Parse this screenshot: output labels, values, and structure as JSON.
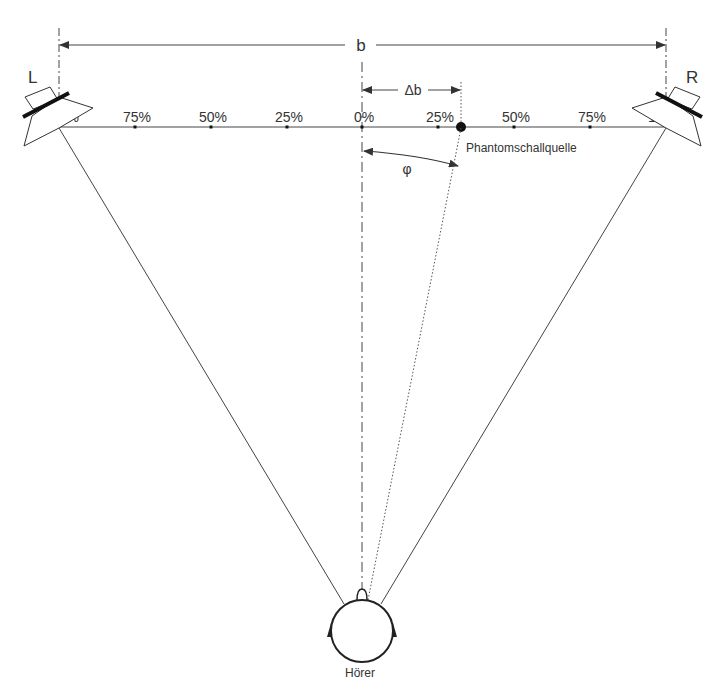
{
  "diagram": {
    "speakers": {
      "left_label": "L",
      "right_label": "R"
    },
    "base_width_label": "b",
    "offset_label": "Δb",
    "angle_label": "φ",
    "phantom_source_label": "Phantomschallquelle",
    "listener_label": "Hörer",
    "scale": {
      "left_ticks": [
        "100%",
        "75%",
        "50%",
        "25%"
      ],
      "center_tick": "0%",
      "right_ticks": [
        "25%",
        "50%",
        "75%",
        "100%"
      ]
    },
    "phantom_source_position_percent_right": 32,
    "colors": {
      "line": "#444444",
      "text": "#333333",
      "speaker_bar": "#111111"
    }
  }
}
